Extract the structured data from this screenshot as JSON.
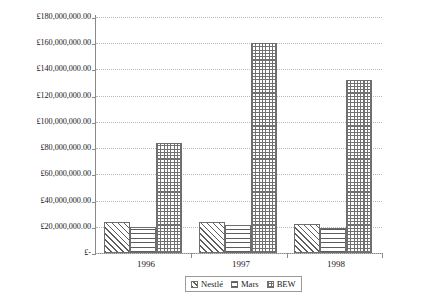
{
  "chart_data": {
    "type": "bar",
    "title": "",
    "subtitle": "",
    "xlabel": "",
    "ylabel": "",
    "categories": [
      "1996",
      "1997",
      "1998"
    ],
    "series": [
      {
        "name": "Nestlé",
        "pattern": "diagonal-hatch",
        "values": [
          24000000,
          24000000,
          22000000
        ]
      },
      {
        "name": "Mars",
        "pattern": "horizontal-lines",
        "values": [
          20000000,
          21000000,
          19000000
        ]
      },
      {
        "name": "BEW",
        "pattern": "checker-dots",
        "values": [
          84000000,
          160000000,
          132000000
        ]
      }
    ],
    "ylim": [
      0,
      180000000
    ],
    "ytick_step": 20000000,
    "ytick_labels": [
      "£180,000,000.00",
      "£160,000,000.00",
      "£140,000,000.00",
      "£120,000,000.00",
      "£100,000,000.00",
      "£80,000,000.00",
      "£60,000,000.00",
      "£40,000,000.00",
      "£20,000,000.00",
      "£-"
    ],
    "ytick_values": [
      180000000,
      160000000,
      140000000,
      120000000,
      100000000,
      80000000,
      60000000,
      40000000,
      20000000,
      0
    ],
    "grid": true,
    "grid_style": "dotted",
    "legend_position": "bottom",
    "currency_symbol": "£"
  },
  "legend": {
    "entries": [
      {
        "label": "Nestlé"
      },
      {
        "label": "Mars"
      },
      {
        "label": "BEW"
      }
    ]
  },
  "axis": {
    "y_labels": [
      "£180,000,000.00",
      "£160,000,000.00",
      "£140,000,000.00",
      "£120,000,000.00",
      "£100,000,000.00",
      "£80,000,000.00",
      "£60,000,000.00",
      "£40,000,000.00",
      "£20,000,000.00",
      "£-"
    ],
    "x_labels": [
      "1996",
      "1997",
      "1998"
    ]
  },
  "colors": {
    "axis": "#8a8a8a",
    "gridline": "#b9b9b9",
    "bar_outline": "#6e6e6e",
    "pattern": "#5d5d5d",
    "text": "#1a1a1a",
    "background": "#ffffff"
  }
}
